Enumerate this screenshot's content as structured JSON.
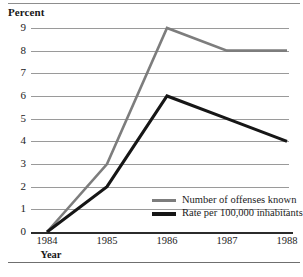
{
  "chart_data": {
    "type": "line",
    "title": "Percent",
    "xlabel": "Year",
    "ylabel": "Percent",
    "categories": [
      "1984",
      "1985",
      "1986",
      "1987",
      "1988"
    ],
    "x": [
      1984,
      1985,
      1986,
      1987,
      1988
    ],
    "ylim": [
      0,
      9
    ],
    "yticks": [
      "0",
      "1",
      "2",
      "3",
      "4",
      "5",
      "6",
      "7",
      "8",
      "9"
    ],
    "grid": "horizontal",
    "legend_position": "inside-bottom-right",
    "series": [
      {
        "name": "Number of offenses known",
        "color": "#7d7d7d",
        "values": [
          0,
          3,
          9,
          8,
          8
        ]
      },
      {
        "name": "Rate per 100,000 inhabitants",
        "color": "#161616",
        "values": [
          0,
          2,
          6,
          5,
          4
        ]
      }
    ]
  },
  "axis": {
    "y_title": "Percent",
    "x_title": "Year",
    "y_ticks": [
      "9",
      "8",
      "7",
      "6",
      "5",
      "4",
      "3",
      "2",
      "1",
      "0"
    ],
    "x_ticks": [
      "1984",
      "1985",
      "1986",
      "1987",
      "1988"
    ]
  },
  "legend": {
    "items": [
      {
        "label": "Number of offenses known",
        "color": "#7d7d7d"
      },
      {
        "label": "Rate per 100,000 inhabitants",
        "color": "#161616"
      }
    ]
  }
}
